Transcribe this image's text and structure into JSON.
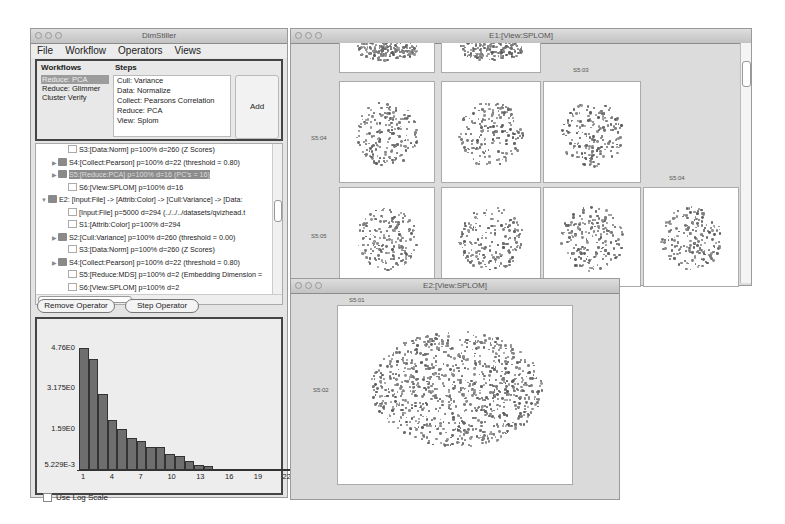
{
  "main_window": {
    "title": "DimStiller",
    "menu": [
      "File",
      "Workflow",
      "Operators",
      "Views"
    ],
    "workflows": {
      "header": "Workflows",
      "items": [
        "Reduce: PCA",
        "Reduce: Glimmer",
        "Cluster Verify"
      ],
      "selected_index": 0
    },
    "steps": {
      "header": "Steps",
      "items": [
        "Cull: Variance",
        "Data: Normalize",
        "Collect: Pearsons Correlation",
        "Reduce: PCA",
        "View: Splom"
      ]
    },
    "add_button": "Add",
    "tree": [
      {
        "indent": 2,
        "icon": "doc",
        "expander": "",
        "text": "S3:[Data:Norm] p=100% d=260 (Z Scores)"
      },
      {
        "indent": 1,
        "icon": "folder",
        "expander": "▶",
        "text": "S4:[Collect:Pearson] p=100% d=22 (threshold = 0.80)"
      },
      {
        "indent": 1,
        "icon": "folder",
        "expander": "▶",
        "text": "S5:[Reduce:PCA] p=100% d=16 (PC's = 16)",
        "selected": true
      },
      {
        "indent": 2,
        "icon": "doc",
        "expander": "",
        "text": "S6:[View:SPLOM] p=100% d=16"
      },
      {
        "indent": 0,
        "icon": "folder",
        "expander": "▼",
        "text": "E2: [Input:File] -> [Attrib:Color] -> [Cull:Variance] -> [Data:"
      },
      {
        "indent": 2,
        "icon": "doc",
        "expander": "",
        "text": "[Input:File] p=5000 d=294 (../../../datasets/qvizhead.t"
      },
      {
        "indent": 2,
        "icon": "doc",
        "expander": "",
        "text": "S1:[Attrib:Color] p=100% d=294"
      },
      {
        "indent": 1,
        "icon": "folder",
        "expander": "▶",
        "text": "S2:[Cull:Variance] p=100% d=260 (threshold = 0.00)"
      },
      {
        "indent": 2,
        "icon": "doc",
        "expander": "",
        "text": "S3:[Data:Norm] p=100% d=260 (Z Scores)"
      },
      {
        "indent": 1,
        "icon": "folder",
        "expander": "▶",
        "text": "S4:[Collect:Pearson] p=100% d=22 (threshold = 0.80)"
      },
      {
        "indent": 2,
        "icon": "doc",
        "expander": "",
        "text": "S5:[Reduce:MDS] p=100% d=2 (Embedding Dimension ="
      },
      {
        "indent": 2,
        "icon": "doc",
        "expander": "",
        "text": "S6:[View:SPLOM] p=100% d=2"
      }
    ],
    "remove_operator": "Remove Operator",
    "step_operator": "Step Operator",
    "use_log_scale": "Use Log Scale"
  },
  "chart_data": {
    "type": "bar",
    "title": "",
    "xlabel": "",
    "ylabel": "",
    "categories": [
      1,
      2,
      3,
      4,
      5,
      6,
      7,
      8,
      9,
      10,
      11,
      12,
      13,
      14,
      15,
      16,
      17,
      18,
      19,
      20,
      21,
      22
    ],
    "values": [
      4.76,
      4.33,
      2.95,
      1.95,
      1.59,
      1.24,
      1.12,
      0.89,
      0.89,
      0.62,
      0.55,
      0.35,
      0.2,
      0.16,
      0.05,
      0.05,
      0.02,
      0.02,
      0.02,
      0.02,
      0.02,
      0.02
    ],
    "y_ticks": [
      "4.76E0",
      "3.175E0",
      "1.59E0",
      "5.229E-3"
    ],
    "x_ticks": [
      "1",
      "4",
      "7",
      "10",
      "13",
      "16",
      "19",
      "22"
    ],
    "ylim": [
      0.005229,
      4.76
    ],
    "grid": false,
    "log_scale": false
  },
  "splom_window": {
    "title": "E1:[View:SPLOM]",
    "labels": {
      "col3": "S5:03",
      "row4": "S5:04",
      "row5": "S5:05",
      "col4": "S5:04"
    }
  },
  "scatter_window": {
    "title": "E2:[View:SPLOM]",
    "x_label": "S5:01",
    "y_label": "S5:02"
  },
  "colors": {
    "selection": "#9c9c9c",
    "bar_fill": "#6e6e6e",
    "point": "#7a7a7a"
  }
}
